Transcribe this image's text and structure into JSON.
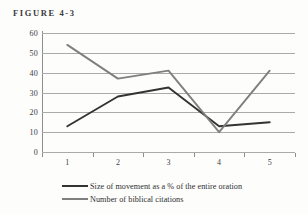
{
  "figure": {
    "title": "FIGURE 4-3"
  },
  "chart_data": {
    "type": "line",
    "title": "FIGURE 4-3",
    "xlabel": "",
    "ylabel": "",
    "categories": [
      "1",
      "2",
      "3",
      "4",
      "5"
    ],
    "ylim": [
      0,
      60
    ],
    "ytick_labels": [
      "0",
      "10",
      "20",
      "30",
      "40",
      "50",
      "60"
    ],
    "ytick_values": [
      0,
      10,
      20,
      30,
      40,
      50,
      60
    ],
    "grid": true,
    "legend_position": "bottom",
    "series": [
      {
        "name": "Size of movement as a % of the entire oration",
        "color": "#333333",
        "values": [
          13,
          28,
          32.5,
          13,
          15
        ]
      },
      {
        "name": "Number of biblical citations",
        "color": "#7f7f7f",
        "values": [
          54,
          37,
          41,
          10,
          41
        ]
      }
    ]
  },
  "legend": {
    "items": [
      {
        "label": "Size of movement as a % of the entire oration",
        "color": "#333333"
      },
      {
        "label": "Number of biblical citations",
        "color": "#7f7f7f"
      }
    ]
  }
}
